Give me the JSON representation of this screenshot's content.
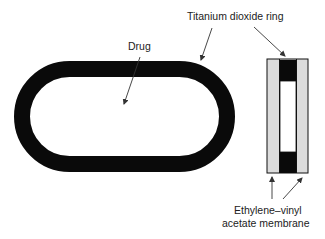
{
  "diagram": {
    "labels": {
      "ring": "Titanium dioxide ring",
      "drug": "Drug",
      "membrane_line1": "Ethylene–vinyl",
      "membrane_line2": "acetate membrane"
    },
    "colors": {
      "ring": "#0a0a0a",
      "membrane": "#dcdcdc",
      "drug_core": "#ffffff",
      "arrow": "#333333"
    }
  }
}
